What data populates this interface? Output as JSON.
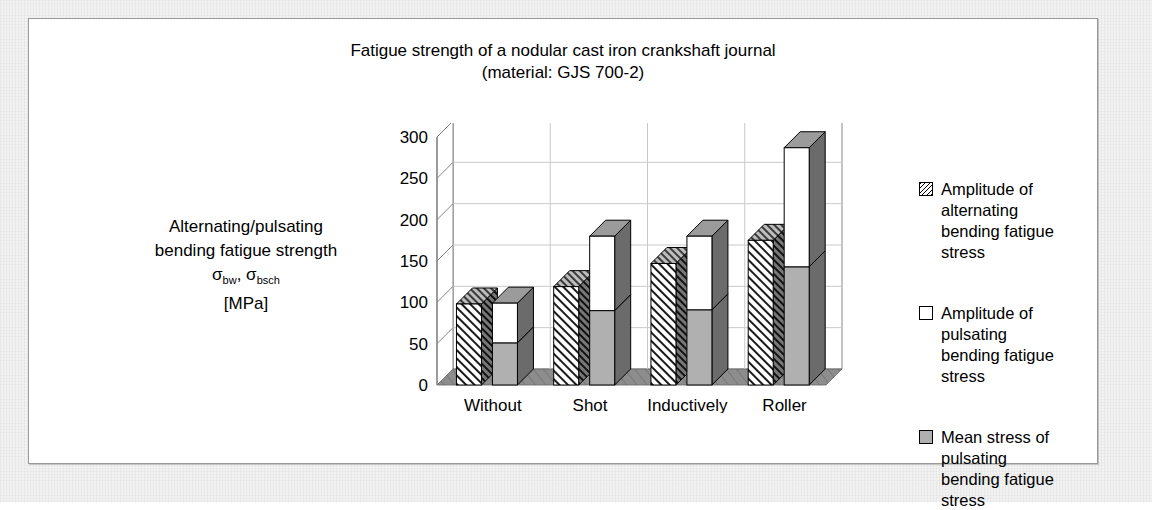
{
  "figure": {
    "title_line1": "Fatigue strength of a nodular cast iron crankshaft journal",
    "title_line2": "(material: GJS 700-2)",
    "axis_caption_line1": "Alternating/pulsating",
    "axis_caption_line2": "bending fatigue strength",
    "axis_caption_symbols_prefix": "σ",
    "axis_caption_sub1": "bw",
    "axis_caption_mid": ", σ",
    "axis_caption_sub2": "bsch",
    "axis_caption_units": "[MPa]"
  },
  "legend": {
    "items": [
      {
        "swatch": "hatched-swatch-icon",
        "line1": "Amplitude of alternating",
        "line2": "bending fatigue stress"
      },
      {
        "swatch": "white-swatch-icon",
        "line1": "Amplitude of pulsating",
        "line2": "bending fatigue stress"
      },
      {
        "swatch": "gray-swatch-icon",
        "line1": "Mean stress of pulsating",
        "line2": "bending fatigue stress"
      }
    ]
  },
  "colors": {
    "bar_gray": "#b0b0b0",
    "bar_white": "#ffffff",
    "bar_outline": "#000000",
    "bar_side_shade": "#6b6b6b",
    "bar_top_shade": "#9b9b9b",
    "floor": "#8d8d8d",
    "gridline": "#c9c9c9",
    "axis": "#7a7a7a",
    "panel_border": "#9a9a9a",
    "mat": "#f2f2f2"
  },
  "chart_data": {
    "type": "bar",
    "title": "Fatigue strength of a nodular cast iron crankshaft journal (material: GJS 700-2)",
    "xlabel": "",
    "ylabel": "Alternating/pulsating bending fatigue strength σbw, σbsch [MPa]",
    "ylim": [
      0,
      300
    ],
    "yticks": [
      0,
      50,
      100,
      150,
      200,
      250,
      300
    ],
    "ytick_labels": [
      "0",
      "50",
      "100",
      "150",
      "200",
      "250",
      "300"
    ],
    "grid": true,
    "legend_position": "right",
    "style": "3d-clustered-stacked",
    "categories": [
      "Without after-treatment",
      "Shot peened radii",
      "Inductively hardened journals/radii",
      "Roller burnished radii"
    ],
    "category_lines": [
      [
        "Without",
        "after-",
        "treatment"
      ],
      [
        "Shot",
        "peened",
        "radii"
      ],
      [
        "Inductively",
        "hardened",
        "journals/radii"
      ],
      [
        "Roller",
        "burnished",
        "radii"
      ]
    ],
    "series": [
      {
        "name": "Amplitude of alternating bending fatigue stress",
        "fill": "hatched",
        "values": [
          98,
          119,
          147,
          175
        ]
      },
      {
        "name": "Mean stress of pulsating bending fatigue stress",
        "fill": "gray",
        "values": [
          51,
          90,
          91,
          143
        ]
      },
      {
        "name": "Amplitude of pulsating bending fatigue stress",
        "fill": "white",
        "values": [
          48,
          90,
          89,
          144
        ]
      }
    ],
    "stacked_totals": [
      99,
      180,
      180,
      287
    ]
  }
}
